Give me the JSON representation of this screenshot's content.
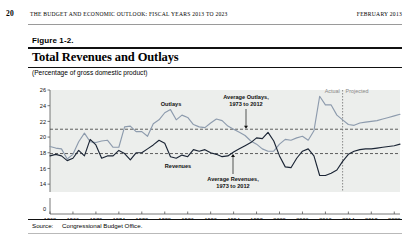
{
  "running_head": {
    "page_number": "20",
    "title": "THE BUDGET AND ECONOMIC OUTLOOK: FISCAL YEARS 2013 TO 2023",
    "date": "FEBRUARY 2013"
  },
  "figure": {
    "number": "Figure 1-2.",
    "title": "Total Revenues and Outlays",
    "units": "(Percentage of gross domestic product)",
    "source_label": "Source:",
    "source_text": "Congressional Budget Office."
  },
  "annotations": {
    "outlays": "Outlays",
    "revenues": "Revenues",
    "avg_outlays_line1": "Average Outlays,",
    "avg_outlays_line2": "1973 to 2012",
    "avg_revenues_line1": "Average Revenues,",
    "avg_revenues_line2": "1973 to 2012",
    "actual": "Actual",
    "projected": "Projected"
  },
  "colors": {
    "outlays_line": "#8d9bad",
    "revenues_line": "#1b2535",
    "average_line": "#3a3a3a",
    "plot_background": "#eceeec",
    "divider": "#6e6e6e",
    "annotation_gray": "#8a8a8a"
  },
  "chart_data": {
    "type": "line",
    "title": "Total Revenues and Outlays",
    "subtitle": "(Percentage of gross domestic product)",
    "xlabel": "",
    "ylabel": "Percentage of gross domestic product",
    "ylim": [
      13.0,
      26.0
    ],
    "y_axis_break_zero": true,
    "yticks": [
      0,
      14,
      16,
      18,
      20,
      22,
      24,
      26
    ],
    "ytick_labels": [
      "0",
      "14",
      "16",
      "18",
      "20",
      "22",
      "24",
      "26"
    ],
    "xlim": [
      1962,
      2023
    ],
    "xticks": [
      1962,
      1966,
      1970,
      1974,
      1978,
      1982,
      1986,
      1990,
      1994,
      1998,
      2002,
      2006,
      2010,
      2014,
      2018,
      2022
    ],
    "xtick_labels": [
      "1962",
      "1966",
      "1970",
      "1974",
      "1978",
      "1982",
      "1986",
      "1990",
      "1994",
      "1998",
      "2002",
      "2006",
      "2010",
      "2014",
      "2018",
      "2022"
    ],
    "grid": false,
    "legend": "inline-annotations",
    "actual_projected_divider_x": 2013,
    "reference_lines": [
      {
        "name": "Average Outlays, 1973 to 2012",
        "value": 21.0,
        "style": "dashed"
      },
      {
        "name": "Average Revenues, 1973 to 2012",
        "value": 17.9,
        "style": "dashed"
      }
    ],
    "x": [
      1962,
      1963,
      1964,
      1965,
      1966,
      1967,
      1968,
      1969,
      1970,
      1971,
      1972,
      1973,
      1974,
      1975,
      1976,
      1977,
      1978,
      1979,
      1980,
      1981,
      1982,
      1983,
      1984,
      1985,
      1986,
      1987,
      1988,
      1989,
      1990,
      1991,
      1992,
      1993,
      1994,
      1995,
      1996,
      1997,
      1998,
      1999,
      2000,
      2001,
      2002,
      2003,
      2004,
      2005,
      2006,
      2007,
      2008,
      2009,
      2010,
      2011,
      2012,
      2013,
      2014,
      2015,
      2016,
      2017,
      2018,
      2019,
      2020,
      2021,
      2022,
      2023
    ],
    "series": [
      {
        "name": "Outlays",
        "color": "#8d9bad",
        "values": [
          18.8,
          18.6,
          18.5,
          17.2,
          17.8,
          19.4,
          20.5,
          19.4,
          19.3,
          19.5,
          19.6,
          18.7,
          18.7,
          21.3,
          21.4,
          20.7,
          20.7,
          20.1,
          21.7,
          22.2,
          23.1,
          23.5,
          22.2,
          22.8,
          22.5,
          21.6,
          21.3,
          21.2,
          21.8,
          22.3,
          22.1,
          21.4,
          21.0,
          20.6,
          20.2,
          19.5,
          19.1,
          18.5,
          18.2,
          18.2,
          19.1,
          19.7,
          19.6,
          19.9,
          20.1,
          19.6,
          20.8,
          25.2,
          24.1,
          24.1,
          22.8,
          22.2,
          21.6,
          21.5,
          21.8,
          21.9,
          22.0,
          22.1,
          22.3,
          22.5,
          22.7,
          22.9
        ]
      },
      {
        "name": "Revenues",
        "color": "#1b2535",
        "values": [
          17.6,
          17.8,
          17.6,
          17.0,
          17.3,
          18.3,
          17.6,
          19.7,
          19.0,
          17.3,
          17.6,
          17.6,
          18.3,
          17.9,
          17.1,
          18.0,
          18.0,
          18.5,
          19.0,
          19.6,
          19.2,
          17.5,
          17.3,
          17.7,
          17.5,
          18.4,
          18.2,
          18.4,
          18.0,
          17.8,
          17.5,
          17.6,
          18.1,
          18.5,
          18.9,
          19.3,
          19.9,
          19.8,
          20.6,
          19.5,
          17.6,
          16.2,
          16.1,
          17.3,
          18.2,
          18.5,
          17.6,
          15.1,
          15.1,
          15.4,
          15.8,
          16.9,
          17.8,
          18.2,
          18.4,
          18.5,
          18.5,
          18.6,
          18.7,
          18.8,
          18.9,
          19.1
        ]
      }
    ]
  }
}
